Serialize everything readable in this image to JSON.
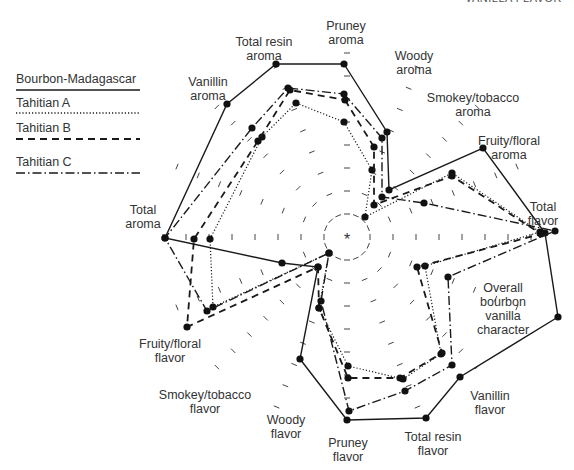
{
  "header": {
    "cut_text": "VANILLA FLAVOR"
  },
  "chart_data": {
    "type": "radar",
    "title": "",
    "center": [
      347,
      237
    ],
    "tick_spacing_px": 23,
    "axes": [
      "Pruney aroma",
      "Woody aroma",
      "Smokey/tobacco aroma",
      "Fruity/floral aroma",
      "Total flavor",
      "Overall bourbon vanilla character",
      "Vanillin flavor",
      "Total resin flavor",
      "Pruney flavor",
      "Woody flavor",
      "Smokey/tobacco flavor",
      "Fruity/floral flavor",
      "Total aroma",
      "Vanillin aroma",
      "Total resin aroma"
    ],
    "legend_position": "upper-left",
    "series": [
      {
        "name": "Bourbon-Madagascar",
        "style": "solid",
        "approx_values": [
          7.5,
          5.2,
          2.5,
          6.3,
          8.6,
          9.5,
          7.5,
          8.6,
          8.1,
          6.3,
          2.0,
          3.0,
          7.9,
          7.7,
          7.9
        ],
        "points": [
          [
            344,
            64
          ],
          [
            387,
            132
          ],
          [
            389,
            190
          ],
          [
            483,
            148
          ],
          [
            545,
            233
          ],
          [
            558,
            317
          ],
          [
            460,
            377
          ],
          [
            426,
            418
          ],
          [
            347,
            420
          ],
          [
            300,
            359
          ],
          [
            318,
            267
          ],
          [
            282,
            263
          ],
          [
            165,
            238
          ],
          [
            227,
            104
          ],
          [
            276,
            64
          ]
        ]
      },
      {
        "name": "Tahitian A",
        "style": "dotted",
        "approx_values": [
          5.0,
          3.2,
          1.2,
          4.8,
          8.2,
          4.7,
          6.1,
          7.0,
          6.5,
          3.5,
          0.9,
          5.9,
          5.9,
          6.2,
          5.9
        ],
        "points": [
          [
            344,
            122
          ],
          [
            372,
            170
          ],
          [
            365,
            217
          ],
          [
            452,
            173
          ],
          [
            540,
            232
          ],
          [
            425,
            266
          ],
          [
            441,
            354
          ],
          [
            403,
            379
          ],
          [
            348,
            366
          ],
          [
            319,
            308
          ],
          [
            329,
            253
          ],
          [
            213,
            307
          ],
          [
            210,
            239
          ],
          [
            262,
            137
          ],
          [
            296,
            103
          ]
        ]
      },
      {
        "name": "Tahitian B",
        "style": "dashed",
        "approx_values": [
          5.9,
          4.6,
          1.8,
          4.7,
          8.3,
          4.4,
          6.3,
          7.0,
          7.6,
          3.5,
          1.8,
          7.2,
          6.6,
          6.3,
          6.5
        ],
        "points": [
          [
            345,
            100
          ],
          [
            374,
            147
          ],
          [
            374,
            205
          ],
          [
            452,
            176
          ],
          [
            541,
            234
          ],
          [
            417,
            267
          ],
          [
            442,
            353
          ],
          [
            400,
            378
          ],
          [
            348,
            378
          ],
          [
            319,
            308
          ],
          [
            318,
            267
          ],
          [
            187,
            327
          ],
          [
            194,
            239
          ],
          [
            258,
            141
          ],
          [
            290,
            90
          ]
        ]
      },
      {
        "name": "Tahitian C",
        "style": "dash-dot",
        "approx_values": [
          6.2,
          4.9,
          2.4,
          3.4,
          9.0,
          4.7,
          5.4,
          6.4,
          7.4,
          3.5,
          0.9,
          6.7,
          7.9,
          6.5,
          6.6
        ],
        "points": [
          [
            344,
            94
          ],
          [
            382,
            138
          ],
          [
            382,
            197
          ],
          [
            424,
            203
          ],
          [
            555,
            231
          ],
          [
            448,
            277
          ],
          [
            452,
            365
          ],
          [
            405,
            391
          ],
          [
            349,
            411
          ],
          [
            321,
            301
          ],
          [
            329,
            253
          ],
          [
            207,
            311
          ],
          [
            165,
            238
          ],
          [
            252,
            128
          ],
          [
            288,
            88
          ]
        ]
      }
    ],
    "axis_labels": [
      {
        "text": "Pruney\naroma",
        "x": 346,
        "y": 19
      },
      {
        "text": "Woody\naroma",
        "x": 414,
        "y": 49
      },
      {
        "text": "Smokey/tobacco\naroma",
        "x": 473,
        "y": 91
      },
      {
        "text": "Fruity/floral\naroma",
        "x": 509,
        "y": 134
      },
      {
        "text": "Total\nflavor",
        "x": 543,
        "y": 200
      },
      {
        "text": "Overall\nbourbon\nvanilla\ncharacter",
        "x": 503,
        "y": 281
      },
      {
        "text": "Vanillin\nflavor",
        "x": 490,
        "y": 389
      },
      {
        "text": "Total resin\nflavor",
        "x": 433,
        "y": 430
      },
      {
        "text": "Pruney\nflavor",
        "x": 348,
        "y": 436
      },
      {
        "text": "Woody\nflavor",
        "x": 286,
        "y": 413
      },
      {
        "text": "Smokey/tobacco\nflavor",
        "x": 205,
        "y": 388
      },
      {
        "text": "Fruity/floral\nflavor",
        "x": 170,
        "y": 337
      },
      {
        "text": "Total\naroma",
        "x": 143,
        "y": 203
      },
      {
        "text": "Vanillin\naroma",
        "x": 208,
        "y": 75
      },
      {
        "text": "Total resin\naroma",
        "x": 264,
        "y": 35
      }
    ]
  },
  "legend": {
    "items": [
      {
        "label": "Bourbon-Madagascar",
        "style": "solid"
      },
      {
        "label": "Tahitian A",
        "style": "dotted"
      },
      {
        "label": "Tahitian B",
        "style": "dashed"
      },
      {
        "label": "Tahitian C",
        "style": "dash-dot"
      }
    ]
  },
  "center_marker": "*"
}
